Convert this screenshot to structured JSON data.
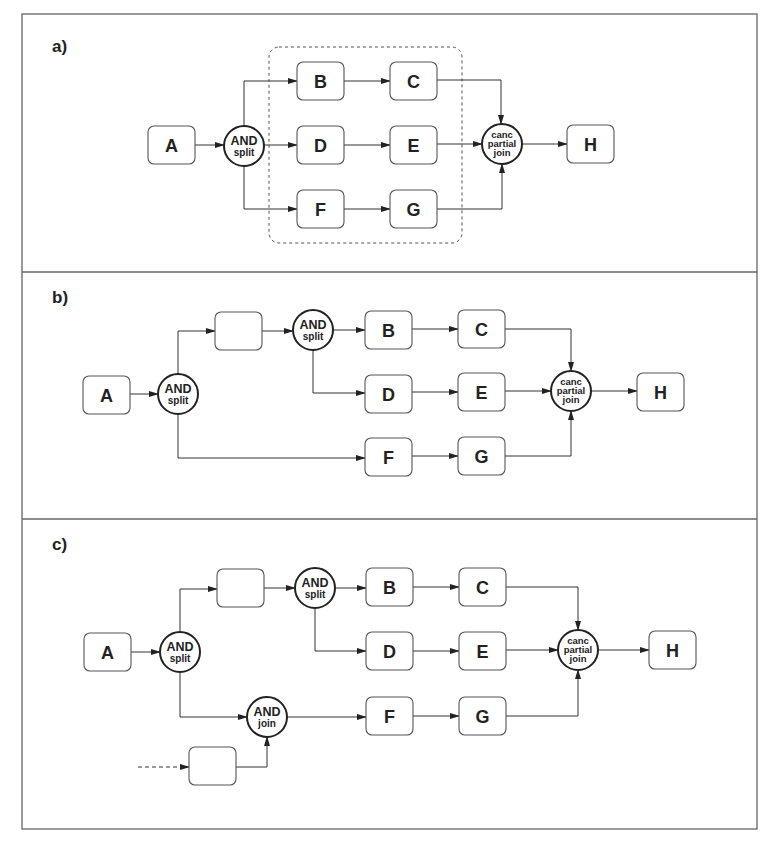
{
  "figure": {
    "frame": {
      "x": 22,
      "y": 14,
      "w": 735,
      "h": 815
    },
    "separators": [
      272,
      519
    ],
    "colors": {
      "stroke": "#333333",
      "box_fill": "#ffffff",
      "background": "#ffffff"
    }
  },
  "panels": [
    {
      "id": "a",
      "label": "a)",
      "label_pos": [
        52,
        52
      ],
      "regions": [
        {
          "name": "cancellation-region",
          "x": 269,
          "y": 47,
          "w": 193,
          "h": 196,
          "r": 10,
          "style": "dashed"
        }
      ],
      "nodes": [
        {
          "id": "A",
          "type": "task",
          "label": "A",
          "x": 148,
          "y": 126,
          "w": 47,
          "h": 38
        },
        {
          "id": "S1",
          "type": "gateway",
          "lines": [
            "AND",
            "split"
          ],
          "cx": 244,
          "cy": 146,
          "r": 20
        },
        {
          "id": "B",
          "type": "task",
          "label": "B",
          "x": 297,
          "y": 62,
          "w": 47,
          "h": 38
        },
        {
          "id": "C",
          "type": "task",
          "label": "C",
          "x": 390,
          "y": 62,
          "w": 47,
          "h": 38
        },
        {
          "id": "D",
          "type": "task",
          "label": "D",
          "x": 297,
          "y": 126,
          "w": 47,
          "h": 38
        },
        {
          "id": "E",
          "type": "task",
          "label": "E",
          "x": 390,
          "y": 126,
          "w": 47,
          "h": 38
        },
        {
          "id": "F",
          "type": "task",
          "label": "F",
          "x": 297,
          "y": 190,
          "w": 47,
          "h": 38
        },
        {
          "id": "G",
          "type": "task",
          "label": "G",
          "x": 390,
          "y": 190,
          "w": 47,
          "h": 38
        },
        {
          "id": "J1",
          "type": "gateway",
          "lines": [
            "canc",
            "partial",
            "join"
          ],
          "cx": 502,
          "cy": 144,
          "r": 20
        },
        {
          "id": "H",
          "type": "task",
          "label": "H",
          "x": 567,
          "y": 125,
          "w": 47,
          "h": 38
        }
      ],
      "edges": [
        {
          "points": [
            [
              195,
              145
            ],
            [
              224,
              145
            ]
          ],
          "arrow": true
        },
        {
          "points": [
            [
              244,
              126
            ],
            [
              244,
              81
            ],
            [
              297,
              81
            ]
          ],
          "arrow": true
        },
        {
          "points": [
            [
              264,
              145
            ],
            [
              297,
              145
            ]
          ],
          "arrow": true
        },
        {
          "points": [
            [
              244,
              166
            ],
            [
              244,
              209
            ],
            [
              297,
              209
            ]
          ],
          "arrow": true
        },
        {
          "points": [
            [
              344,
              81
            ],
            [
              390,
              81
            ]
          ],
          "arrow": true
        },
        {
          "points": [
            [
              344,
              145
            ],
            [
              390,
              145
            ]
          ],
          "arrow": true
        },
        {
          "points": [
            [
              344,
              209
            ],
            [
              390,
              209
            ]
          ],
          "arrow": true
        },
        {
          "points": [
            [
              437,
              80
            ],
            [
              501,
              80
            ],
            [
              501,
              124
            ]
          ],
          "arrow": true
        },
        {
          "points": [
            [
              437,
              144
            ],
            [
              482,
              144
            ]
          ],
          "arrow": true
        },
        {
          "points": [
            [
              437,
              209
            ],
            [
              502,
              209
            ],
            [
              502,
              164
            ]
          ],
          "arrow": true
        },
        {
          "points": [
            [
              522,
              144
            ],
            [
              567,
              144
            ]
          ],
          "arrow": true
        }
      ]
    },
    {
      "id": "b",
      "label": "b)",
      "label_pos": [
        52,
        303
      ],
      "regions": [],
      "nodes": [
        {
          "id": "A",
          "type": "task",
          "label": "A",
          "x": 83,
          "y": 376,
          "w": 47,
          "h": 38
        },
        {
          "id": "S1",
          "type": "gateway",
          "lines": [
            "AND",
            "split"
          ],
          "cx": 178,
          "cy": 394,
          "r": 20
        },
        {
          "id": "X1",
          "type": "task",
          "label": "",
          "x": 215,
          "y": 312,
          "w": 47,
          "h": 38
        },
        {
          "id": "S2",
          "type": "gateway",
          "lines": [
            "AND",
            "split"
          ],
          "cx": 313,
          "cy": 330,
          "r": 20
        },
        {
          "id": "B",
          "type": "task",
          "label": "B",
          "x": 365,
          "y": 311,
          "w": 47,
          "h": 38
        },
        {
          "id": "C",
          "type": "task",
          "label": "C",
          "x": 458,
          "y": 310,
          "w": 47,
          "h": 38
        },
        {
          "id": "D",
          "type": "task",
          "label": "D",
          "x": 365,
          "y": 375,
          "w": 47,
          "h": 38
        },
        {
          "id": "E",
          "type": "task",
          "label": "E",
          "x": 458,
          "y": 373,
          "w": 47,
          "h": 38
        },
        {
          "id": "F",
          "type": "task",
          "label": "F",
          "x": 365,
          "y": 438,
          "w": 47,
          "h": 38
        },
        {
          "id": "G",
          "type": "task",
          "label": "G",
          "x": 458,
          "y": 437,
          "w": 47,
          "h": 38
        },
        {
          "id": "J1",
          "type": "gateway",
          "lines": [
            "canc",
            "partial",
            "join"
          ],
          "cx": 571,
          "cy": 391,
          "r": 20
        },
        {
          "id": "H",
          "type": "task",
          "label": "H",
          "x": 637,
          "y": 373,
          "w": 47,
          "h": 38
        }
      ],
      "edges": [
        {
          "points": [
            [
              130,
              394
            ],
            [
              158,
              394
            ]
          ],
          "arrow": true
        },
        {
          "points": [
            [
              178,
              374
            ],
            [
              178,
              331
            ],
            [
              215,
              331
            ]
          ],
          "arrow": true
        },
        {
          "points": [
            [
              178,
              414
            ],
            [
              178,
              458
            ],
            [
              365,
              458
            ]
          ],
          "arrow": true
        },
        {
          "points": [
            [
              262,
              331
            ],
            [
              293,
              331
            ]
          ],
          "arrow": true
        },
        {
          "points": [
            [
              333,
              330
            ],
            [
              365,
              330
            ]
          ],
          "arrow": true
        },
        {
          "points": [
            [
              313,
              350
            ],
            [
              313,
              393
            ],
            [
              365,
              393
            ]
          ],
          "arrow": true
        },
        {
          "points": [
            [
              412,
              329
            ],
            [
              458,
              329
            ]
          ],
          "arrow": true
        },
        {
          "points": [
            [
              412,
              392
            ],
            [
              458,
              392
            ]
          ],
          "arrow": true
        },
        {
          "points": [
            [
              412,
              456
            ],
            [
              458,
              456
            ]
          ],
          "arrow": true
        },
        {
          "points": [
            [
              505,
              329
            ],
            [
              571,
              329
            ],
            [
              571,
              371
            ]
          ],
          "arrow": true
        },
        {
          "points": [
            [
              505,
              391
            ],
            [
              551,
              391
            ]
          ],
          "arrow": true
        },
        {
          "points": [
            [
              505,
              456
            ],
            [
              571,
              456
            ],
            [
              571,
              411
            ]
          ],
          "arrow": true
        },
        {
          "points": [
            [
              591,
              391
            ],
            [
              637,
              391
            ]
          ],
          "arrow": true
        }
      ]
    },
    {
      "id": "c",
      "label": "c)",
      "label_pos": [
        52,
        550
      ],
      "regions": [],
      "nodes": [
        {
          "id": "A",
          "type": "task",
          "label": "A",
          "x": 84,
          "y": 633,
          "w": 47,
          "h": 38
        },
        {
          "id": "S1",
          "type": "gateway",
          "lines": [
            "AND",
            "split"
          ],
          "cx": 180,
          "cy": 652,
          "r": 20
        },
        {
          "id": "X1",
          "type": "task",
          "label": "",
          "x": 217,
          "y": 569,
          "w": 47,
          "h": 38
        },
        {
          "id": "S2",
          "type": "gateway",
          "lines": [
            "AND",
            "split"
          ],
          "cx": 315,
          "cy": 588,
          "r": 20
        },
        {
          "id": "B",
          "type": "task",
          "label": "B",
          "x": 366,
          "y": 568,
          "w": 47,
          "h": 38
        },
        {
          "id": "C",
          "type": "task",
          "label": "C",
          "x": 459,
          "y": 568,
          "w": 47,
          "h": 38
        },
        {
          "id": "D",
          "type": "task",
          "label": "D",
          "x": 366,
          "y": 632,
          "w": 47,
          "h": 38
        },
        {
          "id": "E",
          "type": "task",
          "label": "E",
          "x": 459,
          "y": 632,
          "w": 47,
          "h": 38
        },
        {
          "id": "J0",
          "type": "gateway",
          "lines": [
            "AND",
            "join"
          ],
          "cx": 267,
          "cy": 717,
          "r": 20
        },
        {
          "id": "F",
          "type": "task",
          "label": "F",
          "x": 366,
          "y": 697,
          "w": 47,
          "h": 38
        },
        {
          "id": "G",
          "type": "task",
          "label": "G",
          "x": 459,
          "y": 697,
          "w": 47,
          "h": 38
        },
        {
          "id": "X2",
          "type": "task",
          "label": "",
          "x": 189,
          "y": 747,
          "w": 47,
          "h": 38
        },
        {
          "id": "J1",
          "type": "gateway",
          "lines": [
            "canc",
            "partial",
            "join"
          ],
          "cx": 578,
          "cy": 650,
          "r": 20
        },
        {
          "id": "H",
          "type": "task",
          "label": "H",
          "x": 649,
          "y": 631,
          "w": 47,
          "h": 38
        }
      ],
      "edges": [
        {
          "points": [
            [
              131,
              652
            ],
            [
              160,
              652
            ]
          ],
          "arrow": true
        },
        {
          "points": [
            [
              180,
              632
            ],
            [
              180,
              589
            ],
            [
              217,
              589
            ]
          ],
          "arrow": true
        },
        {
          "points": [
            [
              180,
              672
            ],
            [
              180,
              717
            ],
            [
              247,
              717
            ]
          ],
          "arrow": true
        },
        {
          "points": [
            [
              264,
              588
            ],
            [
              295,
              588
            ]
          ],
          "arrow": true
        },
        {
          "points": [
            [
              335,
              588
            ],
            [
              366,
              588
            ]
          ],
          "arrow": true
        },
        {
          "points": [
            [
              315,
              608
            ],
            [
              315,
              651
            ],
            [
              366,
              651
            ]
          ],
          "arrow": true
        },
        {
          "points": [
            [
              287,
              717
            ],
            [
              366,
              717
            ]
          ],
          "arrow": true
        },
        {
          "points": [
            [
              236,
              767
            ],
            [
              267,
              767
            ],
            [
              267,
              737
            ]
          ],
          "arrow": true
        },
        {
          "points": [
            [
              138,
              767
            ],
            [
              189,
              767
            ]
          ],
          "arrow": true,
          "dashed": true
        },
        {
          "points": [
            [
              413,
              587
            ],
            [
              459,
              587
            ]
          ],
          "arrow": true
        },
        {
          "points": [
            [
              413,
              651
            ],
            [
              459,
              651
            ]
          ],
          "arrow": true
        },
        {
          "points": [
            [
              413,
              716
            ],
            [
              459,
              716
            ]
          ],
          "arrow": true
        },
        {
          "points": [
            [
              506,
              587
            ],
            [
              578,
              587
            ],
            [
              578,
              630
            ]
          ],
          "arrow": true
        },
        {
          "points": [
            [
              506,
              650
            ],
            [
              558,
              650
            ]
          ],
          "arrow": true
        },
        {
          "points": [
            [
              506,
              716
            ],
            [
              578,
              716
            ],
            [
              578,
              670
            ]
          ],
          "arrow": true
        },
        {
          "points": [
            [
              598,
              650
            ],
            [
              649,
              650
            ]
          ],
          "arrow": true
        }
      ]
    }
  ]
}
